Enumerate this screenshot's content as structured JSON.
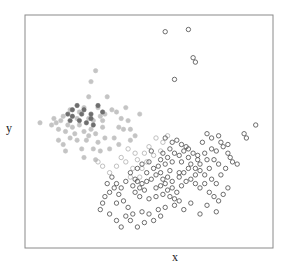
{
  "chart_data": {
    "type": "scatter",
    "title": "",
    "xlabel": "x",
    "ylabel": "y",
    "grid": false,
    "ticks": false,
    "legend": null,
    "xlim": [
      0,
      100
    ],
    "ylim": [
      0,
      100
    ],
    "plot_box_px": {
      "left": 25,
      "top": 15,
      "right": 273,
      "bottom": 248
    },
    "series": [
      {
        "name": "group_filled_light",
        "marker": "filled-circle",
        "color": "#c4c4c4",
        "points": [
          [
            27,
            78
          ],
          [
            25,
            73
          ],
          [
            24,
            66
          ],
          [
            32,
            66
          ],
          [
            28,
            61
          ],
          [
            3,
            54
          ],
          [
            20,
            59
          ],
          [
            13,
            57
          ],
          [
            12,
            55
          ],
          [
            15,
            53
          ],
          [
            17,
            52
          ],
          [
            14,
            50
          ],
          [
            18,
            49
          ],
          [
            22,
            50
          ],
          [
            25,
            51
          ],
          [
            26,
            55
          ],
          [
            30,
            55
          ],
          [
            31,
            47
          ],
          [
            35,
            47
          ],
          [
            28,
            45
          ],
          [
            23,
            46
          ],
          [
            19,
            46
          ],
          [
            16,
            47
          ],
          [
            11,
            51
          ],
          [
            10,
            54
          ],
          [
            13,
            44
          ],
          [
            21,
            42
          ],
          [
            26,
            42
          ],
          [
            29,
            41
          ],
          [
            33,
            42
          ],
          [
            37,
            44
          ],
          [
            38,
            56
          ],
          [
            41,
            55
          ],
          [
            39,
            51
          ],
          [
            42,
            51
          ],
          [
            36,
            59
          ],
          [
            40,
            61
          ],
          [
            34,
            60
          ],
          [
            9,
            56
          ],
          [
            8,
            53
          ],
          [
            27,
            49
          ],
          [
            24,
            48
          ],
          [
            30,
            52
          ],
          [
            20,
            53
          ],
          [
            31,
            58
          ],
          [
            14,
            41
          ],
          [
            22,
            38
          ],
          [
            27,
            37
          ],
          [
            11,
            46
          ],
          [
            24,
            56
          ],
          [
            29,
            57
          ],
          [
            19,
            56
          ],
          [
            44,
            48
          ],
          [
            42,
            46
          ],
          [
            37,
            52
          ],
          [
            46,
            58
          ],
          [
            16,
            60
          ],
          [
            22,
            61
          ]
        ]
      },
      {
        "name": "group_filled_dark",
        "marker": "filled-circle",
        "color": "#6e6e6e",
        "points": [
          [
            17,
            60
          ],
          [
            19,
            62
          ],
          [
            21,
            58
          ],
          [
            22,
            60
          ],
          [
            17,
            57
          ],
          [
            25,
            58
          ],
          [
            25,
            56
          ],
          [
            28,
            62
          ],
          [
            30,
            59
          ],
          [
            23,
            54
          ],
          [
            26,
            53
          ],
          [
            20,
            55
          ],
          [
            15,
            58
          ],
          [
            16,
            55
          ]
        ]
      },
      {
        "name": "group_open_light",
        "marker": "open-circle",
        "color": "#b0b0b0",
        "points": [
          [
            41,
            42
          ],
          [
            44,
            40
          ],
          [
            48,
            40
          ],
          [
            45,
            37
          ],
          [
            49,
            36
          ],
          [
            52,
            39
          ],
          [
            55,
            41
          ],
          [
            40,
            36
          ],
          [
            43,
            33
          ],
          [
            47,
            33
          ],
          [
            38,
            38
          ],
          [
            50,
            43
          ],
          [
            53,
            47
          ],
          [
            56,
            45
          ],
          [
            36,
            34
          ],
          [
            33,
            31
          ],
          [
            30,
            34
          ],
          [
            28,
            36
          ],
          [
            46,
            29
          ],
          [
            42,
            29
          ],
          [
            58,
            48
          ]
        ]
      },
      {
        "name": "group_open_dark",
        "marker": "open-circle",
        "color": "#4a4a4a",
        "points": [
          [
            57,
            96
          ],
          [
            67,
            97
          ],
          [
            69,
            84
          ],
          [
            70,
            82
          ],
          [
            61,
            74
          ],
          [
            96,
            53
          ],
          [
            91,
            49
          ],
          [
            92,
            47
          ],
          [
            57,
            47
          ],
          [
            60,
            45
          ],
          [
            62,
            46
          ],
          [
            59,
            42
          ],
          [
            64,
            44
          ],
          [
            66,
            43
          ],
          [
            61,
            40
          ],
          [
            55,
            37
          ],
          [
            57,
            35
          ],
          [
            60,
            36
          ],
          [
            64,
            36
          ],
          [
            67,
            38
          ],
          [
            71,
            37
          ],
          [
            74,
            40
          ],
          [
            77,
            42
          ],
          [
            79,
            41
          ],
          [
            82,
            43
          ],
          [
            84,
            40
          ],
          [
            86,
            36
          ],
          [
            73,
            45
          ],
          [
            75,
            49
          ],
          [
            77,
            47
          ],
          [
            80,
            48
          ],
          [
            81,
            45
          ],
          [
            84,
            44
          ],
          [
            75,
            37
          ],
          [
            78,
            37
          ],
          [
            80,
            35
          ],
          [
            76,
            33
          ],
          [
            72,
            32
          ],
          [
            70,
            30
          ],
          [
            67,
            33
          ],
          [
            63,
            31
          ],
          [
            59,
            32
          ],
          [
            55,
            31
          ],
          [
            53,
            30
          ],
          [
            51,
            28
          ],
          [
            49,
            27
          ],
          [
            47,
            26
          ],
          [
            45,
            27
          ],
          [
            43,
            25
          ],
          [
            44,
            22
          ],
          [
            46,
            20
          ],
          [
            50,
            19
          ],
          [
            53,
            20
          ],
          [
            56,
            21
          ],
          [
            58,
            23
          ],
          [
            60,
            24
          ],
          [
            62,
            22
          ],
          [
            64,
            25
          ],
          [
            66,
            27
          ],
          [
            68,
            28
          ],
          [
            70,
            26
          ],
          [
            72,
            24
          ],
          [
            74,
            26
          ],
          [
            76,
            22
          ],
          [
            78,
            20
          ],
          [
            80,
            18
          ],
          [
            82,
            21
          ],
          [
            84,
            24
          ],
          [
            63,
            18
          ],
          [
            61,
            16
          ],
          [
            57,
            15
          ],
          [
            54,
            14
          ],
          [
            50,
            12
          ],
          [
            47,
            13
          ],
          [
            43,
            12
          ],
          [
            41,
            15
          ],
          [
            39,
            18
          ],
          [
            37,
            21
          ],
          [
            35,
            24
          ],
          [
            33,
            22
          ],
          [
            36,
            17
          ],
          [
            40,
            11
          ],
          [
            42,
            9
          ],
          [
            45,
            6
          ],
          [
            48,
            8
          ],
          [
            52,
            9
          ],
          [
            55,
            11
          ],
          [
            65,
            14
          ],
          [
            68,
            17
          ],
          [
            72,
            12
          ],
          [
            75,
            16
          ],
          [
            79,
            13
          ],
          [
            49,
            31
          ],
          [
            52,
            33
          ],
          [
            54,
            34
          ],
          [
            56,
            28
          ],
          [
            58,
            29
          ],
          [
            60,
            27
          ],
          [
            63,
            29
          ],
          [
            65,
            31
          ],
          [
            68,
            35
          ],
          [
            70,
            33
          ],
          [
            72,
            35
          ],
          [
            74,
            30
          ],
          [
            77,
            28
          ],
          [
            79,
            26
          ],
          [
            81,
            30
          ],
          [
            83,
            33
          ],
          [
            85,
            38
          ],
          [
            88,
            35
          ],
          [
            53,
            24
          ],
          [
            55,
            25
          ],
          [
            57,
            26
          ],
          [
            59,
            20
          ],
          [
            61,
            19
          ],
          [
            48,
            23
          ],
          [
            46,
            24
          ],
          [
            44,
            28
          ],
          [
            42,
            31
          ],
          [
            40,
            27
          ],
          [
            38,
            24
          ],
          [
            36,
            26
          ],
          [
            34,
            29
          ],
          [
            32,
            26
          ],
          [
            31,
            20
          ],
          [
            30,
            17
          ],
          [
            29,
            14
          ],
          [
            33,
            12
          ],
          [
            36,
            9
          ],
          [
            38,
            6
          ],
          [
            63,
            39
          ],
          [
            65,
            41
          ],
          [
            67,
            42
          ],
          [
            69,
            40
          ],
          [
            71,
            39
          ],
          [
            58,
            38
          ],
          [
            56,
            40
          ],
          [
            50,
            36
          ],
          [
            47,
            35
          ],
          [
            45,
            33
          ],
          [
            51,
            41
          ]
        ]
      }
    ]
  }
}
